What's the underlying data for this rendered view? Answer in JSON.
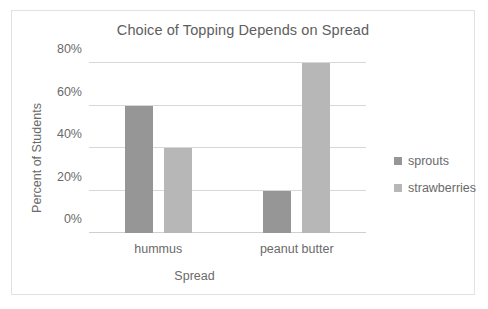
{
  "chart_data": {
    "type": "bar",
    "title": "Choice of Topping Depends on Spread",
    "xlabel": "Spread",
    "ylabel": "Percent of Students",
    "categories": [
      "hummus",
      "peanut butter"
    ],
    "series": [
      {
        "name": "sprouts",
        "values": [
          60,
          20
        ],
        "color": "#969696"
      },
      {
        "name": "strawberries",
        "values": [
          40,
          80
        ],
        "color": "#b7b7b7"
      }
    ],
    "ylim": [
      0,
      80
    ],
    "yticks": [
      0,
      20,
      40,
      60,
      80
    ],
    "ytick_labels": [
      "0%",
      "20%",
      "40%",
      "60%",
      "80%"
    ],
    "grid": true,
    "legend_position": "right",
    "border_color": "#e2e2e2",
    "gridline_color": "#d8d8d8",
    "text_color": "#6a6a6a",
    "title_color": "#5e5e5e"
  }
}
